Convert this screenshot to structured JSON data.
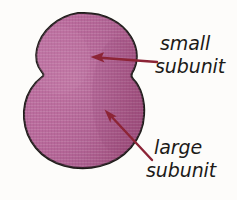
{
  "figure": {
    "background_color": "#fdfcfa",
    "width": 237,
    "height": 200
  },
  "shape": {
    "name": "ribosome",
    "fill_color": "#b9699b",
    "fill_color_light": "#c77faa",
    "fill_color_dark": "#a9548c",
    "outline_color": "#1e1b19",
    "texture": "fine-woven-crosshatch"
  },
  "arrows": {
    "color": "#8c2436",
    "items": [
      {
        "name": "arrow-to-small-subunit",
        "points_to": "small subunit",
        "direction": "left",
        "tip_x": 91,
        "tip_y": 57,
        "tail_x": 157,
        "tail_y": 62
      },
      {
        "name": "arrow-to-large-subunit",
        "points_to": "large subunit",
        "direction": "up-left",
        "tip_x": 105,
        "tip_y": 110,
        "tail_x": 152,
        "tail_y": 160
      }
    ]
  },
  "labels": [
    {
      "name": "small-subunit-label",
      "line1": "small",
      "line2": "subunit",
      "color": "#1c1a18"
    },
    {
      "name": "large-subunit-label",
      "line1": "large",
      "line2": "subunit",
      "color": "#1c1a18"
    }
  ]
}
